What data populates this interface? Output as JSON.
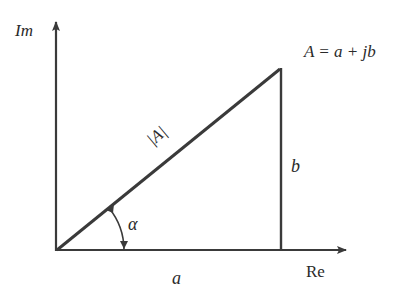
{
  "diagram": {
    "type": "complex-number-phasor",
    "axes": {
      "imaginary_label": "Im",
      "real_label": "Re"
    },
    "equation": "A = a + jb",
    "magnitude_label": "|A|",
    "angle_label": "α",
    "real_part_label": "a",
    "imaginary_part_label": "b",
    "colors": {
      "stroke": "#3a3a3a",
      "text": "#2a2a2a",
      "background": "#ffffff"
    }
  }
}
